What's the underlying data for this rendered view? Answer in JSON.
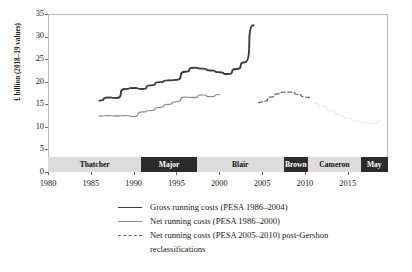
{
  "chart_data": {
    "type": "line",
    "title": "",
    "xlabel": "",
    "ylabel": "£ billion (2018–19 values)",
    "xlim": [
      1980,
      2019.7
    ],
    "ylim": [
      0,
      35
    ],
    "yticks": [
      0,
      5,
      10,
      15,
      20,
      25,
      30,
      35
    ],
    "xticks": [
      1980,
      1985,
      1990,
      1995,
      2000,
      2005,
      2010,
      2015
    ],
    "grid": false,
    "legend_position": "below",
    "series": [
      {
        "name": "Gross running costs (PESA 1986–2004)",
        "style": "solid",
        "color": "#3a3a42",
        "width": 1.9,
        "x": [
          1986,
          1987,
          1988,
          1989,
          1990,
          1991,
          1992,
          1993,
          1994,
          1995,
          1996,
          1997,
          1998,
          1999,
          2000,
          2001,
          2002,
          2003,
          2004
        ],
        "y": [
          15.8,
          16.5,
          16.4,
          18.4,
          18.6,
          18.4,
          19.2,
          19.9,
          20.3,
          20.4,
          22.2,
          23.1,
          22.9,
          22.5,
          22.1,
          21.7,
          22.8,
          24.3,
          32.5
        ]
      },
      {
        "name": "Net running costs (PESA 1986–2000)",
        "style": "solid",
        "color": "#8e8e96",
        "width": 1.3,
        "x": [
          1986,
          1987,
          1988,
          1989,
          1990,
          1991,
          1992,
          1993,
          1994,
          1995,
          1996,
          1997,
          1998,
          1999,
          2000
        ],
        "y": [
          12.4,
          12.5,
          12.4,
          12.5,
          12.3,
          13.3,
          13.6,
          14.3,
          15.0,
          15.6,
          16.6,
          16.5,
          17.1,
          16.7,
          17.2
        ]
      },
      {
        "name": "Net running costs (PESA 2005–2010) post-Gershon reclassifications",
        "style": "dashed",
        "color": "#66666e",
        "width": 1.3,
        "x": [
          2004.6,
          2005.3,
          2006,
          2006.8,
          2007.6,
          2008.4,
          2009.2,
          2010,
          2010.6
        ],
        "y": [
          15.4,
          15.7,
          16.6,
          17.3,
          17.7,
          17.7,
          17.2,
          16.6,
          16.5
        ]
      },
      {
        "name": "",
        "style": "dotted",
        "color": "#e2e2e6",
        "width": 1.1,
        "x": [
          2011,
          2012,
          2013,
          2014,
          2015,
          2016,
          2017,
          2018,
          2019
        ],
        "y": [
          15.3,
          14.6,
          13.6,
          12.7,
          11.9,
          11.3,
          10.9,
          10.8,
          11.3
        ]
      }
    ],
    "annotations": {
      "era_band_label": "UK Prime Ministers",
      "eras": [
        {
          "label": "Thatcher",
          "start": 1980,
          "end": 1990.9,
          "shade": "light"
        },
        {
          "label": "Major",
          "start": 1990.9,
          "end": 1997.4,
          "shade": "dark"
        },
        {
          "label": "Blair",
          "start": 1997.4,
          "end": 2007.5,
          "shade": "light"
        },
        {
          "label": "Brown",
          "start": 2007.5,
          "end": 2010.4,
          "shade": "dark"
        },
        {
          "label": "Cameron",
          "start": 2010.4,
          "end": 2016.5,
          "shade": "light"
        },
        {
          "label": "May",
          "start": 2016.5,
          "end": 2019.7,
          "shade": "dark"
        }
      ]
    },
    "legend_entries": [
      {
        "label": "Gross running costs (PESA 1986–2004)",
        "style": "solid-dark",
        "line2": ""
      },
      {
        "label": "Net running costs (PESA 1986–2000)",
        "style": "solid-light",
        "line2": ""
      },
      {
        "label": "Net running costs (PESA 2005–2010) post-Gershon",
        "style": "dashed",
        "line2": "reclassifications"
      }
    ]
  },
  "colors": {
    "gross_line": "#3a3a42",
    "net_line": "#8e8e96",
    "dashed_line": "#66666e",
    "dotted_line": "#e2e2e6",
    "era_light": "#dcdcdc",
    "era_dark": "#2b2b2b",
    "axis": "#b9b9b9",
    "background": "#ffffff"
  }
}
